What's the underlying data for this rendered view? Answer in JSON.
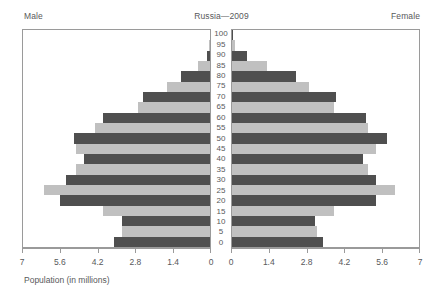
{
  "header": {
    "male_label": "Male",
    "title": "Russia—2009",
    "female_label": "Female"
  },
  "axis": {
    "x_title": "Population (in millions)",
    "ticks": [
      "7",
      "5.6",
      "4.2",
      "2.8",
      "1.4",
      "0"
    ],
    "ticks_female": [
      "0",
      "1.4",
      "2.8",
      "4.2",
      "5.6",
      "7"
    ]
  },
  "colors": {
    "bar_dark": "#4f4f4f",
    "bar_light": "#c0c0c0",
    "frame": "#9a9a9a",
    "text": "#58595b",
    "background": "#ffffff"
  },
  "chart_data": {
    "type": "bar",
    "subtype": "population-pyramid",
    "title": "Russia—2009",
    "xlabel": "Population (in millions)",
    "ylabel": "",
    "xlim": [
      0,
      7
    ],
    "xticks": [
      0,
      1.4,
      2.8,
      4.2,
      5.6,
      7
    ],
    "grid": false,
    "legend": [
      "Male",
      "Female"
    ],
    "legend_position": "top-corners",
    "categories": [
      "0",
      "5",
      "10",
      "15",
      "20",
      "25",
      "30",
      "35",
      "40",
      "45",
      "50",
      "55",
      "60",
      "65",
      "70",
      "75",
      "80",
      "85",
      "90",
      "95",
      "100"
    ],
    "series": [
      {
        "name": "Male",
        "direction": "left",
        "values": [
          3.6,
          3.3,
          3.3,
          4.0,
          5.6,
          6.2,
          5.4,
          5.0,
          4.7,
          5.0,
          5.1,
          4.3,
          4.0,
          2.7,
          2.5,
          1.6,
          1.1,
          0.45,
          0.12,
          0.03,
          0.01
        ]
      },
      {
        "name": "Female",
        "direction": "right",
        "values": [
          3.4,
          3.2,
          3.1,
          3.8,
          5.4,
          6.1,
          5.4,
          5.1,
          4.9,
          5.4,
          5.8,
          5.1,
          5.0,
          3.8,
          3.9,
          2.9,
          2.4,
          1.3,
          0.55,
          0.1,
          0.02
        ]
      }
    ]
  }
}
